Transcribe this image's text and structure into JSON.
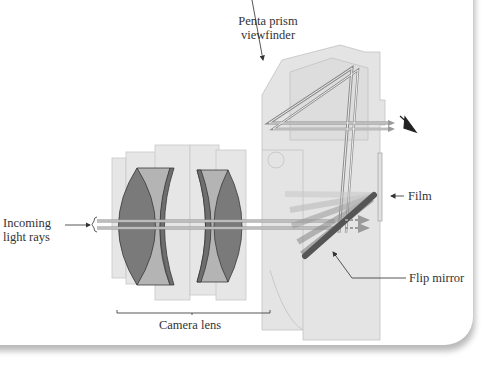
{
  "diagram": {
    "type": "labeled-illustration",
    "labels": {
      "pentaprism_line1": "Penta prism",
      "pentaprism_line2": "viewfinder",
      "incoming_line1": "Incoming",
      "incoming_line2": "light rays",
      "film": "Film",
      "flip_mirror": "Flip mirror",
      "camera_lens": "Camera lens"
    },
    "colors": {
      "body_fill": "#e4e4e4",
      "body_stroke": "#c2c2c2",
      "lens_dark": "#7a7a7a",
      "lens_light": "#b4b4b4",
      "ray": "#8c8c8c",
      "mirror": "#555555",
      "label_text": "#333333",
      "leader": "#444444"
    }
  }
}
